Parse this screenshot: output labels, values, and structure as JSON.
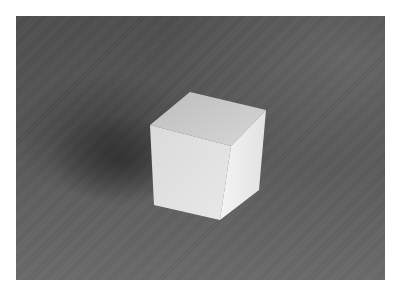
{
  "image": {
    "subject": "white cube on gray surface",
    "colors": {
      "background_page": "#ffffff",
      "surface": "#575757",
      "cube_top": "#d0d0d0",
      "cube_front": "#e4e4e4",
      "cube_right": "#f2f2f2",
      "shadow": "#2e2e2e"
    }
  }
}
